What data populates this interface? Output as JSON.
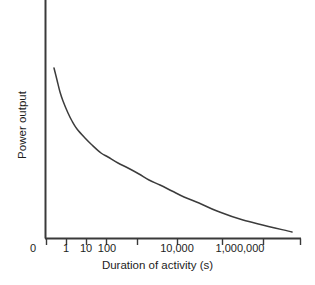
{
  "chart_data": {
    "type": "line",
    "title": "",
    "subtitle": "",
    "xlabel": "Duration of activity (s)",
    "ylabel": "Power output",
    "grid": false,
    "legend": null,
    "annotations": [],
    "x_axis": {
      "scale": "log",
      "origin_label": "0",
      "tick_labels": [
        "0",
        "1",
        "10",
        "100",
        "10,000",
        "1,000,000"
      ],
      "labeled_ticks": [
        {
          "label": "1",
          "px": 66
        },
        {
          "label": "10",
          "px": 86
        },
        {
          "label": "100",
          "px": 107
        },
        {
          "label": "10,000",
          "px": 177
        },
        {
          "label": "1,000,000",
          "px": 240
        }
      ],
      "tick_positions_px": [
        46,
        66,
        86,
        106,
        137,
        177,
        222,
        263,
        300
      ],
      "axis_start_px": 45,
      "axis_end_px": 301
    },
    "y_axis": {
      "scale": "linear",
      "tick_labels": [],
      "ylim": [
        0,
        1
      ],
      "axis_top_px": 0,
      "axis_bottom_px": 238
    },
    "series": [
      {
        "name": "Power output",
        "x": [
          0.3,
          0.5,
          0.8,
          1,
          2,
          3,
          5,
          10,
          20,
          50,
          100,
          300,
          1000,
          3000,
          10000,
          30000,
          100000,
          300000,
          1000000,
          3000000,
          10000000,
          40000000
        ],
        "y": [
          1.0,
          0.86,
          0.76,
          0.72,
          0.62,
          0.56,
          0.5,
          0.43,
          0.38,
          0.32,
          0.285,
          0.245,
          0.21,
          0.18,
          0.155,
          0.135,
          0.115,
          0.097,
          0.082,
          0.068,
          0.055,
          0.042
        ],
        "points_px": [
          [
            54,
            68
          ],
          [
            57,
            80
          ],
          [
            60,
            92
          ],
          [
            63,
            101
          ],
          [
            68,
            113
          ],
          [
            72,
            121
          ],
          [
            77,
            129
          ],
          [
            85,
            138
          ],
          [
            92,
            145
          ],
          [
            101,
            153
          ],
          [
            108,
            157
          ],
          [
            118,
            163
          ],
          [
            128,
            168
          ],
          [
            139,
            174
          ],
          [
            149,
            180
          ],
          [
            160,
            185
          ],
          [
            172,
            191
          ],
          [
            184,
            197
          ],
          [
            199,
            203
          ],
          [
            217,
            211
          ],
          [
            243,
            220
          ],
          [
            292,
            232
          ]
        ]
      }
    ],
    "colors": {
      "curve": "#3c3c3c",
      "axis": "#3a3a3a",
      "text": "#1d1d1d",
      "background": "#ffffff"
    }
  },
  "labels": {
    "xlabel": "Duration of activity (s)",
    "ylabel": "Power output",
    "xtick_0": "0",
    "xtick_1": "1",
    "xtick_2": "10",
    "xtick_3": "100",
    "xtick_4": "10,000",
    "xtick_5": "1,000,000"
  }
}
